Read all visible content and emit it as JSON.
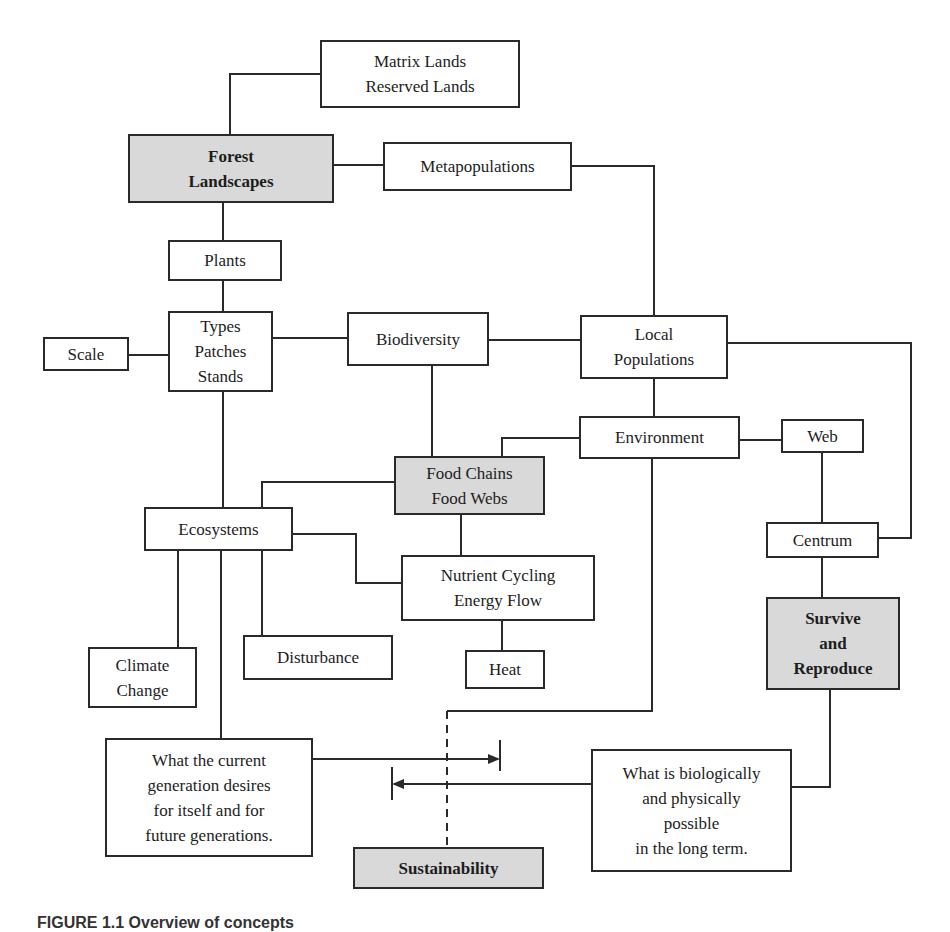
{
  "diagram": {
    "nodes": {
      "matrix_lands": {
        "label": "Matrix Lands\nReserved Lands"
      },
      "forest_landscapes": {
        "label": "Forest\nLandscapes"
      },
      "metapopulations": {
        "label": "Metapopulations"
      },
      "plants": {
        "label": "Plants"
      },
      "types_patches_stands": {
        "label": "Types\nPatches\nStands"
      },
      "scale": {
        "label": "Scale"
      },
      "biodiversity": {
        "label": "Biodiversity"
      },
      "local_populations": {
        "label": "Local\nPopulations"
      },
      "environment": {
        "label": "Environment"
      },
      "web": {
        "label": "Web"
      },
      "food_chains": {
        "label": "Food Chains\nFood Webs"
      },
      "ecosystems": {
        "label": "Ecosystems"
      },
      "nutrient_cycling": {
        "label": "Nutrient Cycling\nEnergy Flow"
      },
      "centrum": {
        "label": "Centrum"
      },
      "survive_reproduce": {
        "label": "Survive\nand\nReproduce"
      },
      "climate_change": {
        "label": "Climate\nChange"
      },
      "disturbance": {
        "label": "Disturbance"
      },
      "heat": {
        "label": "Heat"
      },
      "current_generation": {
        "label": "What the current\ngeneration desires\nfor itself and for\nfuture generations."
      },
      "biologically_possible": {
        "label": "What is biologically\nand physically\npossible\nin the long term."
      },
      "sustainability": {
        "label": "Sustainability"
      }
    },
    "colors": {
      "line": "#2a2a2a",
      "shaded_fill": "#d9d9d9",
      "box_fill": "#ffffff"
    },
    "caption": "FIGURE 1.1  Overview of concepts"
  }
}
